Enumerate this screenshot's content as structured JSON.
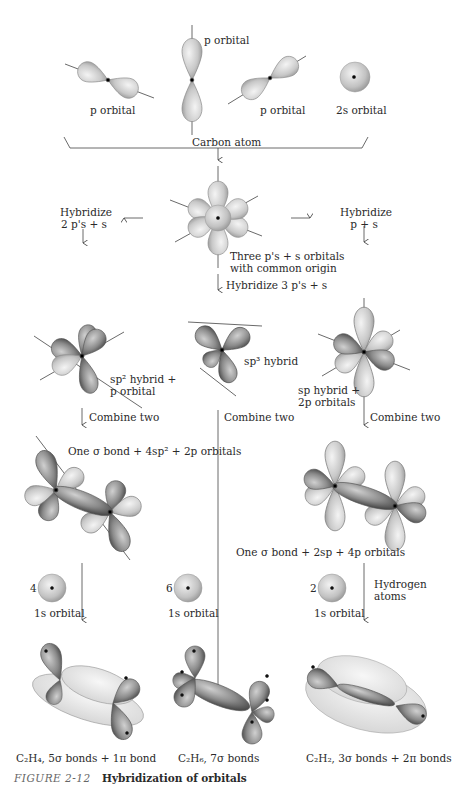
{
  "top_row": {
    "p_orbital_left": "p orbital",
    "p_orbital_center": "p orbital",
    "p_orbital_right": "p orbital",
    "s_orbital": "2s orbital",
    "group_label": "Carbon atom"
  },
  "center_node": {
    "label_line1": "Three p's + s orbitals",
    "label_line2": "with common origin"
  },
  "branches": {
    "left": {
      "line1": "Hybridize",
      "line2": "2 p's + s"
    },
    "right": {
      "line1": "Hybridize",
      "line2": "p + s"
    },
    "center": "Hybridize 3 p's + s"
  },
  "hybrids": {
    "sp2": {
      "line1": "sp² hybrid +",
      "line2": "p orbital"
    },
    "sp3": "sp³ hybrid",
    "sp": {
      "line1": "sp hybrid +",
      "line2": "2p orbitals"
    }
  },
  "combine": {
    "left": "Combine two",
    "center": "Combine two",
    "right": "Combine two"
  },
  "combined": {
    "left": "One σ bond + 4sp² + 2p orbitals",
    "right": "One σ bond + 2sp + 4p orbitals"
  },
  "hydrogen": {
    "left_count": "4",
    "center_count": "6",
    "right_count": "2",
    "orbital_label": "1s orbital",
    "atoms_line1": "Hydrogen",
    "atoms_line2": "atoms"
  },
  "molecules": {
    "ethylene": "C₂H₄, 5σ bonds + 1π bond",
    "ethane": "C₂H₆, 7σ bonds",
    "acetylene": "C₂H₂, 3σ bonds + 2π bonds"
  },
  "figure": {
    "number": "FIGURE 2-12",
    "title": "Hybridization of orbitals"
  }
}
